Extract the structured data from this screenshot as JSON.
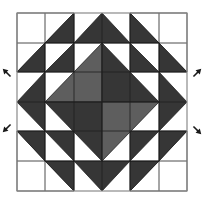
{
  "diagram": {
    "type": "quilt-block",
    "colors": {
      "background": "#ffffff",
      "border": "#8a8a8a",
      "dark": "#363636",
      "medium": "#5e5e5e",
      "light": "#ffffff",
      "seam": "#1e1e1e",
      "arrow": "#1a1a1a"
    },
    "block": {
      "x": 17,
      "y": 13,
      "width": 170,
      "height": 178
    },
    "grid": {
      "cols": [
        17,
        45,
        74,
        102,
        130,
        159,
        187
      ],
      "rows": [
        13,
        43,
        72,
        102,
        131,
        161,
        191
      ]
    },
    "pieces": [
      {
        "name": "top-left-big-triangle",
        "fill": "light",
        "points": "17,13 74,13 17,72"
      },
      {
        "name": "top-left-hst-a",
        "fill": "dark",
        "points": "74,13 74,43 45,43"
      },
      {
        "name": "top-left-hst-b",
        "fill": "dark",
        "points": "45,43 45,72 17,72"
      },
      {
        "name": "top-left-hst-c",
        "fill": "dark",
        "points": "74,43 74,72 45,72"
      },
      {
        "name": "top-left-inner-light",
        "fill": "light",
        "points": "45,43 74,43 45,72"
      },
      {
        "name": "top-right-big-triangle",
        "fill": "light",
        "points": "130,13 187,13 187,72"
      },
      {
        "name": "top-right-hst-a",
        "fill": "dark",
        "points": "130,13 130,43 159,43"
      },
      {
        "name": "top-right-hst-b",
        "fill": "dark",
        "points": "159,43 159,72 187,72"
      },
      {
        "name": "top-right-hst-c",
        "fill": "dark",
        "points": "130,43 130,72 159,72"
      },
      {
        "name": "top-right-inner-light",
        "fill": "light",
        "points": "130,43 159,43 159,72"
      },
      {
        "name": "bottom-left-big-triangle",
        "fill": "light",
        "points": "17,131 17,191 74,191"
      },
      {
        "name": "bottom-left-hst-a",
        "fill": "dark",
        "points": "17,131 45,131 45,161"
      },
      {
        "name": "bottom-left-hst-b",
        "fill": "dark",
        "points": "45,131 74,131 74,161"
      },
      {
        "name": "bottom-left-hst-c",
        "fill": "dark",
        "points": "45,161 74,161 74,191"
      },
      {
        "name": "bottom-left-inner-light",
        "fill": "light",
        "points": "45,131 74,161 45,161"
      },
      {
        "name": "bottom-right-big-triangle",
        "fill": "light",
        "points": "187,131 187,191 130,191"
      },
      {
        "name": "bottom-right-hst-a",
        "fill": "dark",
        "points": "159,131 187,131 159,161"
      },
      {
        "name": "bottom-right-hst-b",
        "fill": "dark",
        "points": "130,131 159,131 130,161"
      },
      {
        "name": "bottom-right-hst-c",
        "fill": "dark",
        "points": "130,161 159,161 130,191"
      },
      {
        "name": "bottom-right-inner-light",
        "fill": "light",
        "points": "159,131 159,161 130,161"
      },
      {
        "name": "top-goose",
        "fill": "dark",
        "points": "102,13 130,43 74,43"
      },
      {
        "name": "bottom-goose",
        "fill": "dark",
        "points": "74,161 130,161 102,191"
      },
      {
        "name": "left-goose",
        "fill": "dark",
        "points": "45,72 45,131 17,102"
      },
      {
        "name": "right-goose",
        "fill": "dark",
        "points": "159,72 187,102 159,131"
      },
      {
        "name": "center-diamond-top-left",
        "fill": "medium",
        "points": "102,43 102,102 45,102"
      },
      {
        "name": "center-diamond-top-right",
        "fill": "dark",
        "points": "102,43 159,102 102,102"
      },
      {
        "name": "center-diamond-bottom-left",
        "fill": "dark",
        "points": "45,102 102,102 102,161"
      },
      {
        "name": "center-diamond-bottom-right",
        "fill": "medium",
        "points": "102,102 159,102 102,161"
      }
    ],
    "seams": [
      "17,43 187,43",
      "17,72 187,72",
      "17,102 45,102",
      "159,102 187,102",
      "17,131 187,131",
      "17,161 187,161",
      "45,13 45,191",
      "74,13 74,191",
      "102,13 102,43",
      "102,161 102,191",
      "130,13 130,191",
      "159,13 159,191",
      "45,102 159,102",
      "102,43 102,161"
    ],
    "arrows": [
      {
        "name": "arrow-up-left",
        "x": 7,
        "y": 73,
        "direction": "north-west",
        "rotate": -135
      },
      {
        "name": "arrow-down-left",
        "x": 7,
        "y": 128,
        "direction": "south-west",
        "rotate": 135
      },
      {
        "name": "arrow-up-right",
        "x": 197,
        "y": 73,
        "direction": "north-east",
        "rotate": -45
      },
      {
        "name": "arrow-down-right",
        "x": 197,
        "y": 130,
        "direction": "south-east",
        "rotate": 45
      }
    ]
  }
}
